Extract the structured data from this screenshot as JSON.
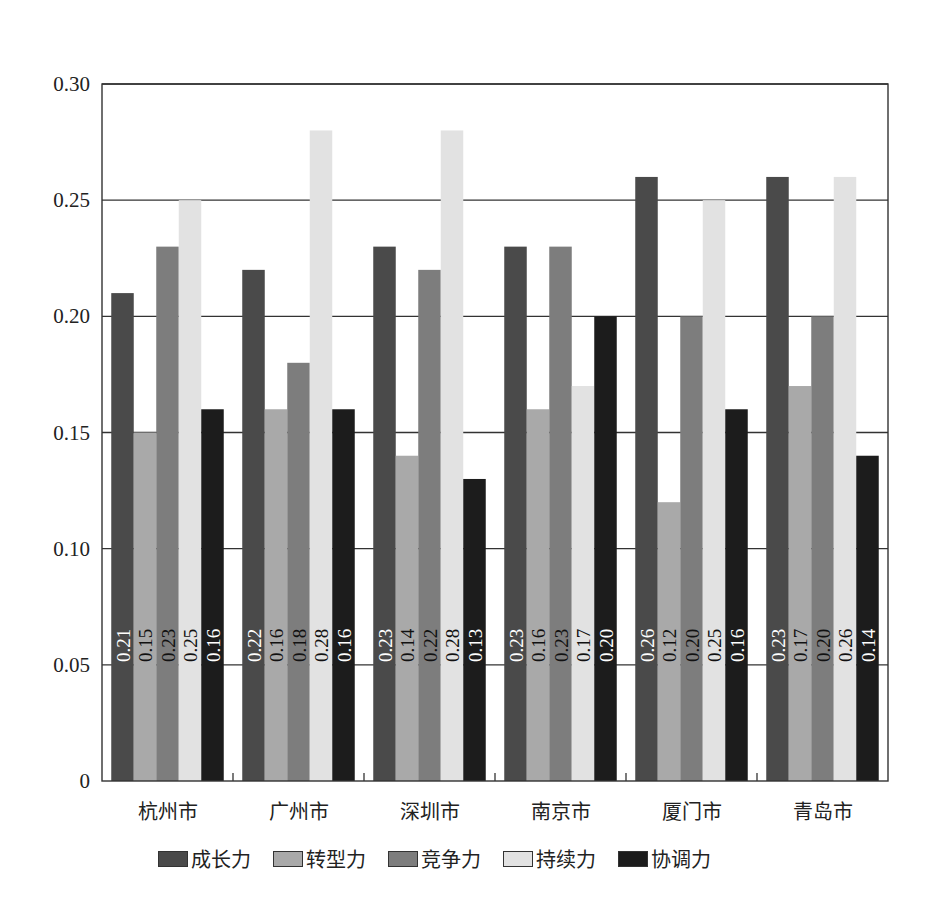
{
  "chart_data": {
    "type": "bar",
    "title": "",
    "xlabel": "",
    "ylabel": "",
    "ylim": [
      0,
      0.3
    ],
    "yticks": [
      "0",
      "0.05",
      "0.10",
      "0.15",
      "0.20",
      "0.25",
      "0.30"
    ],
    "grid": true,
    "legend_position": "bottom",
    "categories": [
      "杭州市",
      "广州市",
      "深圳市",
      "南京市",
      "厦门市",
      "青岛市"
    ],
    "series": [
      {
        "name": "成长力",
        "color": "#4a4a4a",
        "label_color": "#ffffff",
        "values": [
          0.21,
          0.22,
          0.23,
          0.23,
          0.26,
          0.26
        ],
        "labels": [
          "0.21",
          "0.22",
          "0.23",
          "0.23",
          "0.26",
          "0.23"
        ]
      },
      {
        "name": "转型力",
        "color": "#a9a9a9",
        "label_color": "#111111",
        "values": [
          0.15,
          0.16,
          0.14,
          0.16,
          0.12,
          0.17
        ],
        "labels": [
          "0.15",
          "0.16",
          "0.14",
          "0.16",
          "0.12",
          "0.17"
        ]
      },
      {
        "name": "竞争力",
        "color": "#7d7d7d",
        "label_color": "#111111",
        "values": [
          0.23,
          0.18,
          0.22,
          0.23,
          0.2,
          0.2
        ],
        "labels": [
          "0.23",
          "0.18",
          "0.22",
          "0.23",
          "0.20",
          "0.20"
        ]
      },
      {
        "name": "持续力",
        "color": "#e2e2e2",
        "label_color": "#111111",
        "values": [
          0.25,
          0.28,
          0.28,
          0.17,
          0.25,
          0.26
        ],
        "labels": [
          "0.25",
          "0.28",
          "0.28",
          "0.17",
          "0.25",
          "0.26"
        ]
      },
      {
        "name": "协调力",
        "color": "#1c1c1c",
        "label_color": "#ffffff",
        "values": [
          0.16,
          0.16,
          0.13,
          0.2,
          0.16,
          0.14
        ],
        "labels": [
          "0.16",
          "0.16",
          "0.13",
          "0.20",
          "0.16",
          "0.14"
        ]
      }
    ]
  }
}
